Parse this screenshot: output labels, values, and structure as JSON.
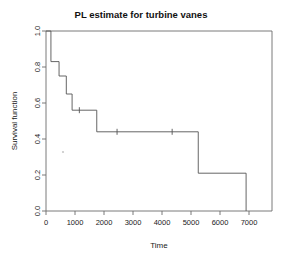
{
  "chart_data": {
    "type": "line",
    "subtype": "kaplan-meier-step",
    "title": "PL estimate for turbine vanes",
    "xlabel": "Time",
    "ylabel": "Survival function",
    "xlim": [
      0,
      7100
    ],
    "ylim": [
      0.0,
      1.0
    ],
    "grid": false,
    "legend": null,
    "xticks": [
      0,
      1000,
      2000,
      3000,
      4000,
      5000,
      6000,
      7000
    ],
    "xtick_labels": [
      "0",
      "1000",
      "2000",
      "3000",
      "4000",
      "5000",
      "6000",
      "7000"
    ],
    "yticks": [
      0.0,
      0.2,
      0.4,
      0.6,
      0.8,
      1.0
    ],
    "ytick_labels": [
      "0.0",
      "0.2",
      "0.4",
      "0.6",
      "0.8",
      "1.0"
    ],
    "series": [
      {
        "name": "PL estimate",
        "step_points": [
          {
            "time": 0,
            "survival": 1.0
          },
          {
            "time": 170,
            "survival": 1.0
          },
          {
            "time": 170,
            "survival": 0.83
          },
          {
            "time": 450,
            "survival": 0.83
          },
          {
            "time": 450,
            "survival": 0.75
          },
          {
            "time": 700,
            "survival": 0.75
          },
          {
            "time": 700,
            "survival": 0.65
          },
          {
            "time": 900,
            "survival": 0.65
          },
          {
            "time": 900,
            "survival": 0.56
          },
          {
            "time": 1750,
            "survival": 0.56
          },
          {
            "time": 1750,
            "survival": 0.44
          },
          {
            "time": 5250,
            "survival": 0.44
          },
          {
            "time": 5250,
            "survival": 0.21
          },
          {
            "time": 6900,
            "survival": 0.21
          },
          {
            "time": 6900,
            "survival": 0.0
          }
        ],
        "censored_points": [
          {
            "time": 1150,
            "survival": 0.56
          },
          {
            "time": 2450,
            "survival": 0.44
          },
          {
            "time": 4350,
            "survival": 0.44
          }
        ]
      }
    ]
  },
  "axes": {
    "y_title": "Survival function",
    "x_title": "Time"
  },
  "header": {
    "title": "PL estimate for turbine vanes"
  }
}
